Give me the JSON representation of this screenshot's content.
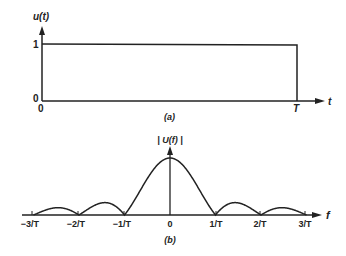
{
  "chart_data": [
    {
      "id": "a",
      "type": "line",
      "title": "",
      "caption": "(a)",
      "xlabel": "t",
      "ylabel": "u(t)",
      "x_ticks": [
        "0",
        "T"
      ],
      "y_ticks": [
        "0",
        "1"
      ],
      "x": [
        0,
        0,
        1,
        1
      ],
      "x_units": "T",
      "values": [
        0,
        1,
        1,
        0
      ],
      "description": "Rectangular pulse of unit amplitude from t=0 to t=T",
      "grid": false,
      "legend": null
    },
    {
      "id": "b",
      "type": "line",
      "title": "",
      "caption": "(b)",
      "xlabel": "f",
      "ylabel": "|U(f)|",
      "x_ticks": [
        "−3/T",
        "−2/T",
        "−1/T",
        "0",
        "1/T",
        "2/T",
        "3/T"
      ],
      "x": [
        -3,
        -2.5,
        -2,
        -1.5,
        -1,
        -0.5,
        0,
        0.5,
        1,
        1.5,
        2,
        2.5,
        3
      ],
      "x_units": "1/T",
      "values": [
        0,
        0.127,
        0,
        0.212,
        0,
        0.637,
        1,
        0.637,
        0,
        0.212,
        0,
        0.127,
        0
      ],
      "description": "Magnitude spectrum |sinc(fT)| with nulls at multiples of 1/T",
      "grid": false,
      "legend": null
    }
  ],
  "labels": {
    "a": {
      "ylabel": "u(t)",
      "y_one": "1",
      "y_zero": "0",
      "x_zero": "0",
      "x_T": "T",
      "xlabel": "t",
      "caption": "(a)"
    },
    "b": {
      "ylabel": "| U(f) |",
      "xlabel": "f",
      "caption": "(b)",
      "ticks": [
        "−3/T",
        "−2/T",
        "−1/T",
        "0",
        "1/T",
        "2/T",
        "3/T"
      ]
    }
  },
  "colors": {
    "ink": "#222222",
    "background": "#ffffff"
  }
}
